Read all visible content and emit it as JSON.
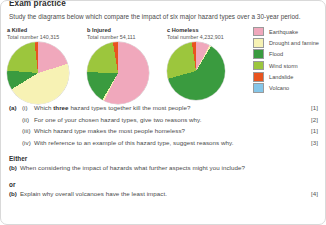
{
  "header": {
    "title": "Exam practice",
    "intro": "Study the diagrams below which compare the impact of six major hazard types over a 30-year period."
  },
  "legend": {
    "items": [
      {
        "label": "Earthquake",
        "color": "#f0a8bc"
      },
      {
        "label": "Drought and famine",
        "color": "#f7f2b4"
      },
      {
        "label": "Flood",
        "color": "#3a9b3f"
      },
      {
        "label": "Wind storm",
        "color": "#9cc63d"
      },
      {
        "label": "Landslide",
        "color": "#e8541f"
      },
      {
        "label": "Volcano",
        "color": "#85c6e8"
      }
    ]
  },
  "chart_data": [
    {
      "type": "pie",
      "id": "a",
      "heading": "a Killed",
      "total_label": "Total number 140,315",
      "total": 140315,
      "categories": [
        "Earthquake",
        "Drought and famine",
        "Flood",
        "Wind storm",
        "Landslide",
        "Volcano"
      ],
      "values": [
        18,
        46,
        10,
        22,
        3,
        1
      ],
      "unit": "percent",
      "legend": "right"
    },
    {
      "type": "pie",
      "id": "b",
      "heading": "b Injured",
      "total_label": "Total number 54,111",
      "total": 54111,
      "categories": [
        "Earthquake",
        "Drought and famine",
        "Flood",
        "Wind storm",
        "Landslide",
        "Volcano"
      ],
      "values": [
        56,
        1,
        17,
        22,
        3,
        1
      ],
      "unit": "percent",
      "legend": "right"
    },
    {
      "type": "pie",
      "id": "c",
      "heading": "c Homeless",
      "total_label": "Total number 4,232,901",
      "total": 4232901,
      "categories": [
        "Earthquake",
        "Drought and famine",
        "Flood",
        "Wind storm",
        "Landslide",
        "Volcano"
      ],
      "values": [
        6,
        1,
        62,
        27,
        3,
        1
      ],
      "unit": "percent",
      "legend": "right"
    }
  ],
  "questions": {
    "a_label": "(a)",
    "items": [
      {
        "roman": "(i)",
        "text_before": "Which ",
        "emphasis": "three",
        "text_after": " hazard types together kill the most people?",
        "marks": "[1]"
      },
      {
        "roman": "(ii)",
        "text_before": "For one of your chosen hazard types, give two reasons why.",
        "emphasis": "",
        "text_after": "",
        "marks": "[2]"
      },
      {
        "roman": "(iii)",
        "text_before": "Which hazard type makes the most people homeless?",
        "emphasis": "",
        "text_after": "",
        "marks": "[1]"
      },
      {
        "roman": "(iv)",
        "text_before": "With reference to an example of this hazard type, suggest reasons why.",
        "emphasis": "",
        "text_after": "",
        "marks": "[3]"
      }
    ],
    "either_word": "Either",
    "or_word": "or",
    "b_first": {
      "label": "(b)",
      "text": "When considering the impact of hazards what further aspects might you include?",
      "marks": ""
    },
    "b_second": {
      "label": "(b)",
      "text": "Explain why overall volcanoes have the least impact.",
      "marks": "[4]"
    }
  }
}
